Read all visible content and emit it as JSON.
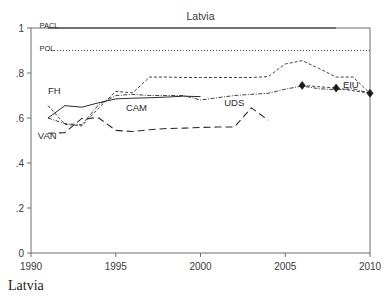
{
  "title": "Latvia",
  "caption": "Latvia",
  "chart_data": {
    "type": "line",
    "title": "Latvia",
    "xlabel": "",
    "ylabel": "",
    "xlim": [
      1990,
      2010
    ],
    "ylim": [
      0,
      1
    ],
    "grid": false,
    "legend": "inline-labels",
    "xticks": [
      "1990",
      "1995",
      "2000",
      "2005",
      "2010"
    ],
    "xtick_values": [
      1990,
      1995,
      2000,
      2005,
      2010
    ],
    "yticks": [
      "0",
      ".2",
      ".4",
      ".6",
      ".8",
      "1"
    ],
    "ytick_values": [
      0,
      0.2,
      0.4,
      0.6,
      0.8,
      1
    ],
    "series": [
      {
        "name": "PACL",
        "label": "PACL",
        "style": "solid",
        "label_x": 1990.5,
        "label_y": 1.0,
        "x": [
          1991,
          1993,
          1995,
          1997,
          1999,
          2001,
          2003,
          2005,
          2007,
          2008
        ],
        "values": [
          1,
          1,
          1,
          1,
          1,
          1,
          1,
          1,
          1,
          1
        ]
      },
      {
        "name": "POL",
        "label": "POL",
        "style": "dotted",
        "label_x": 1990.5,
        "label_y": 0.9,
        "x": [
          1991,
          1993,
          1995,
          1997,
          1999,
          2001,
          2003,
          2005,
          2007,
          2009,
          2010
        ],
        "values": [
          0.9,
          0.9,
          0.9,
          0.9,
          0.9,
          0.9,
          0.9,
          0.9,
          0.9,
          0.9,
          0.9
        ]
      },
      {
        "name": "FH",
        "label": "FH",
        "style": "solid",
        "label_x": 1991.0,
        "label_y": 0.705,
        "x": [
          1991,
          1992,
          1993,
          1994,
          1995,
          1996,
          1997,
          1998,
          1999,
          2000
        ],
        "values": [
          0.6,
          0.655,
          0.648,
          0.668,
          0.685,
          0.688,
          0.69,
          0.693,
          0.697,
          0.695
        ]
      },
      {
        "name": "CAM",
        "label": "CAM",
        "style": "dashed-short",
        "label_x": 1995.6,
        "label_y": 0.632,
        "x": [
          1991,
          1992,
          1993,
          1994,
          1995,
          1996,
          1997,
          1998,
          1999,
          2000,
          2001,
          2002,
          2003,
          2004,
          2005,
          2006,
          2007,
          2008,
          2009,
          2010
        ],
        "values": [
          0.655,
          0.572,
          0.565,
          0.645,
          0.718,
          0.712,
          0.782,
          0.782,
          0.78,
          0.78,
          0.78,
          0.78,
          0.78,
          0.784,
          0.84,
          0.855,
          0.82,
          0.782,
          0.782,
          0.71
        ]
      },
      {
        "name": "UDS",
        "label": "UDS",
        "style": "dash-dot-fine",
        "label_x": 2001.4,
        "label_y": 0.655,
        "x": [
          1991,
          1992,
          1993,
          1994,
          1995,
          1996,
          1997,
          1998,
          1999,
          2000,
          2001,
          2002,
          2003,
          2004,
          2005,
          2006,
          2007,
          2008,
          2009,
          2010
        ],
        "values": [
          0.6,
          0.575,
          0.57,
          0.66,
          0.7,
          0.705,
          0.7,
          0.7,
          0.7,
          0.68,
          0.69,
          0.7,
          0.705,
          0.71,
          0.728,
          0.742,
          0.73,
          0.726,
          0.73,
          0.71
        ]
      },
      {
        "name": "VAN",
        "label": "VAN",
        "style": "dashed-long",
        "label_x": 1990.4,
        "label_y": 0.505,
        "x": [
          1991,
          1992,
          1993,
          1994,
          1995,
          1996,
          1997,
          1998,
          1999,
          2000,
          2001,
          2002,
          2003,
          2004
        ],
        "values": [
          0.532,
          0.535,
          0.598,
          0.6,
          0.545,
          0.54,
          0.548,
          0.553,
          0.555,
          0.558,
          0.56,
          0.56,
          0.645,
          0.59
        ]
      },
      {
        "name": "EIU",
        "label": "EIU",
        "style": "markers",
        "label_x": 2008.4,
        "label_y": 0.733,
        "x": [
          2006,
          2008,
          2010
        ],
        "values": [
          0.745,
          0.733,
          0.71
        ]
      }
    ]
  }
}
